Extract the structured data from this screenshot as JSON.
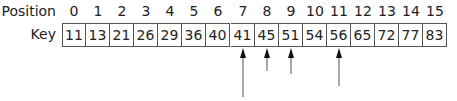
{
  "labels": {
    "position": "Position",
    "key": "Key"
  },
  "positions": [
    "0",
    "1",
    "2",
    "3",
    "4",
    "5",
    "6",
    "7",
    "8",
    "9",
    "10",
    "11",
    "12",
    "13",
    "14",
    "15"
  ],
  "keys": [
    "11",
    "13",
    "21",
    "26",
    "29",
    "36",
    "40",
    "41",
    "45",
    "51",
    "54",
    "56",
    "65",
    "72",
    "77",
    "83"
  ],
  "arrows": [
    {
      "index": 7,
      "length": 49
    },
    {
      "index": 8,
      "length": 23
    },
    {
      "index": 9,
      "length": 26
    },
    {
      "index": 11,
      "length": 38
    }
  ],
  "colors": {
    "line": "#555555",
    "text": "#222222"
  }
}
